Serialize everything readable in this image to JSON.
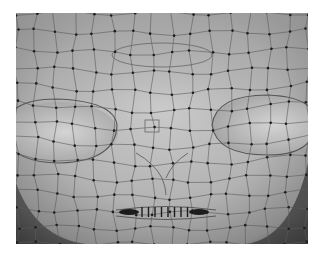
{
  "figure": {
    "colors": {
      "background": "#ffffff",
      "surface_light": "#c8c8c8",
      "surface_mid": "#a8a8a8",
      "surface_dark": "#3a3a3a",
      "wire": "#5a5a5a",
      "vertex": "#1e1e1e"
    },
    "regions": [
      "forehead",
      "left-eye-socket",
      "right-eye-socket",
      "nose",
      "mouth"
    ]
  }
}
